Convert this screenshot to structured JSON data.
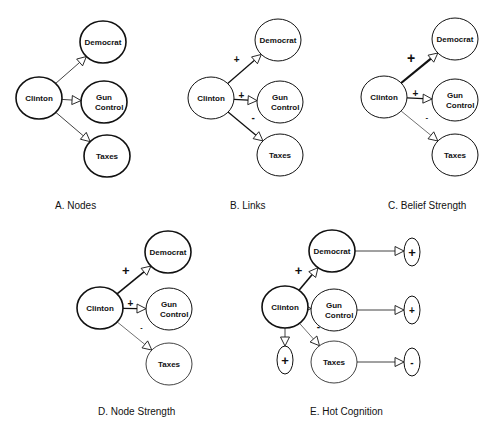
{
  "figure": {
    "panels": [
      {
        "id": "A",
        "caption": "A. Nodes",
        "caption_pos": [
          55,
          209
        ],
        "center": {
          "label": "Clinton",
          "x": 39,
          "y": 98,
          "stroke": 1.6
        },
        "targets": [
          {
            "label": "Democrat",
            "label2": "",
            "x": 103,
            "y": 42,
            "stroke": 1.6,
            "link": {
              "sign": "",
              "width": 0.8,
              "sign_size": 0
            }
          },
          {
            "label": "Gun",
            "label2": "Control",
            "x": 104,
            "y": 102,
            "stroke": 1.6,
            "link": {
              "sign": "",
              "width": 0.8,
              "sign_size": 0
            }
          },
          {
            "label": "Taxes",
            "label2": "",
            "x": 107,
            "y": 156,
            "stroke": 1.6,
            "link": {
              "sign": "",
              "width": 0.8,
              "sign_size": 0
            }
          }
        ]
      },
      {
        "id": "B",
        "caption": "B. Links",
        "caption_pos": [
          230,
          209
        ],
        "center": {
          "label": "Clinton",
          "x": 211,
          "y": 98,
          "stroke": 1
        },
        "targets": [
          {
            "label": "Democrat",
            "label2": "",
            "x": 278,
            "y": 40,
            "stroke": 1,
            "link": {
              "sign": "+",
              "width": 1.3,
              "sign_size": 10
            }
          },
          {
            "label": "Gun",
            "label2": "Control",
            "x": 280,
            "y": 102,
            "stroke": 1,
            "link": {
              "sign": "+",
              "width": 1.3,
              "sign_size": 10
            }
          },
          {
            "label": "Taxes",
            "label2": "",
            "x": 280,
            "y": 155,
            "stroke": 1,
            "link": {
              "sign": "-",
              "width": 1.3,
              "sign_size": 10
            }
          }
        ]
      },
      {
        "id": "C",
        "caption": "C. Belief Strength",
        "caption_pos": [
          388,
          209
        ],
        "center": {
          "label": "Clinton",
          "x": 384,
          "y": 97,
          "stroke": 1
        },
        "targets": [
          {
            "label": "Democrat",
            "label2": "",
            "x": 455,
            "y": 39,
            "stroke": 1,
            "link": {
              "sign": "+",
              "width": 2.2,
              "sign_size": 14
            }
          },
          {
            "label": "Gun",
            "label2": "Control",
            "x": 455,
            "y": 100,
            "stroke": 1,
            "link": {
              "sign": "+",
              "width": 1.2,
              "sign_size": 10
            }
          },
          {
            "label": "Taxes",
            "label2": "",
            "x": 455,
            "y": 155,
            "stroke": 1,
            "link": {
              "sign": "-",
              "width": 0.6,
              "sign_size": 8
            }
          }
        ]
      },
      {
        "id": "D",
        "caption": "D. Node Strength",
        "caption_pos": [
          98,
          415
        ],
        "center": {
          "label": "Clinton",
          "x": 100,
          "y": 308,
          "stroke": 1.6
        },
        "targets": [
          {
            "label": "Democrat",
            "label2": "",
            "x": 168,
            "y": 252,
            "stroke": 1.6,
            "link": {
              "sign": "+",
              "width": 1.6,
              "sign_size": 13
            }
          },
          {
            "label": "Gun",
            "label2": "Control",
            "x": 169,
            "y": 309,
            "stroke": 1,
            "link": {
              "sign": "+",
              "width": 1.2,
              "sign_size": 10
            }
          },
          {
            "label": "Taxes",
            "label2": "",
            "x": 169,
            "y": 364,
            "stroke": 0.8,
            "link": {
              "sign": "-",
              "width": 0.6,
              "sign_size": 7
            }
          }
        ]
      },
      {
        "id": "E",
        "caption": "E. Hot Cognition",
        "caption_pos": [
          310,
          415
        ],
        "center": {
          "label": "Clinton",
          "x": 285,
          "y": 307,
          "stroke": 1.6,
          "affect": {
            "sign": "+",
            "x": 285,
            "y": 360,
            "sign_size": 13
          }
        },
        "targets": [
          {
            "label": "Democrat",
            "label2": "",
            "x": 332,
            "y": 251,
            "stroke": 1.6,
            "link": {
              "sign": "+",
              "width": 1.6,
              "sign_size": 13
            },
            "affect": {
              "sign": "+",
              "x": 412,
              "y": 252,
              "sign_size": 13
            }
          },
          {
            "label": "Gun",
            "label2": "Control",
            "x": 334,
            "y": 310,
            "stroke": 1,
            "link": {
              "sign": "+",
              "width": 1.2,
              "sign_size": 10
            },
            "affect": {
              "sign": "+",
              "x": 412,
              "y": 310,
              "sign_size": 10
            }
          },
          {
            "label": "Taxes",
            "label2": "",
            "x": 334,
            "y": 362,
            "stroke": 0.8,
            "link": {
              "sign": "-",
              "width": 0.6,
              "sign_size": 10
            },
            "affect": {
              "sign": "-",
              "x": 412,
              "y": 362,
              "sign_size": 10
            }
          }
        ]
      }
    ]
  }
}
